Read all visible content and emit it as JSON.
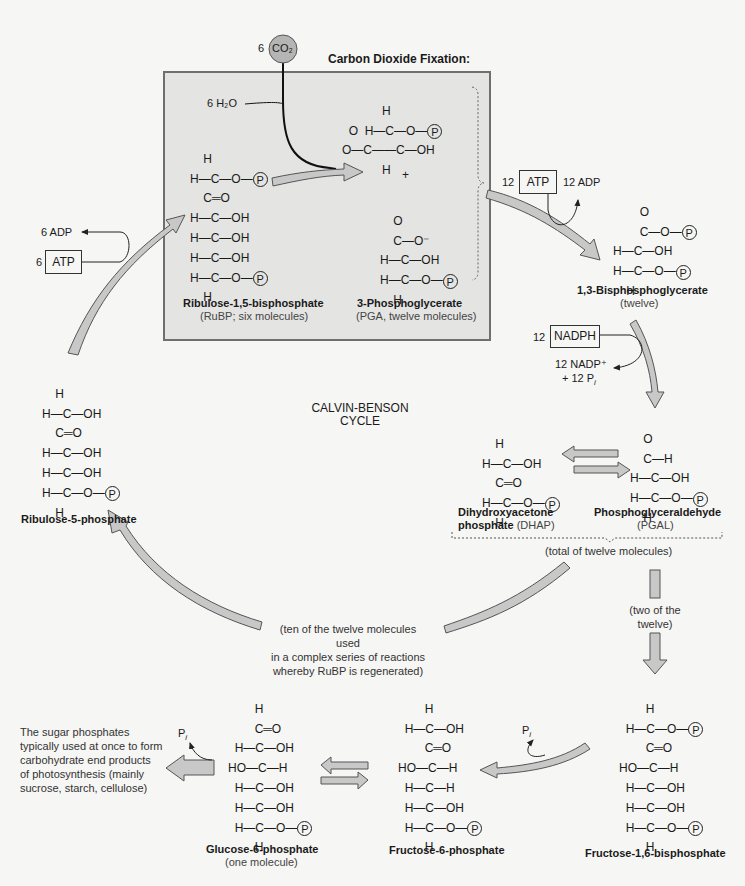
{
  "header": {
    "fixation_title": "Carbon Dioxide Fixation:",
    "co2_count": "6",
    "co2_label": "CO₂",
    "h2o_label": "6 H₂O"
  },
  "cycle_label": [
    "CALVIN-BENSON",
    "CYCLE"
  ],
  "colors": {
    "background": "#f6f6f4",
    "fixation_box": "#e4e4e2",
    "fixation_border": "#6f6f6f",
    "arrow_fill": "#c8c8c8",
    "arrow_stroke": "#555555",
    "co2_circle": "#b5b5b5"
  },
  "molecules": {
    "rubp": {
      "name": "Ribulose-1,5-bisphosphate",
      "sub": "(RuBP; six molecules)",
      "rows": [
        "    H",
        "H—C—O—",
        "    C═O",
        "H—C—OH",
        "H—C—OH",
        "H—C—OH",
        "H—C—O—",
        "    H"
      ]
    },
    "pga": {
      "name": "3-Phosphoglycerate",
      "sub": "(PGA, twelve molecules)",
      "plus": "+"
    },
    "bpg": {
      "name": "1,3-Bisphosphoglycerate",
      "sub": "(twelve)"
    },
    "dhap": {
      "name_line1": "Dihydroxyacetone",
      "name_line2": "phosphate",
      "abbr": "(DHAP)"
    },
    "pgal": {
      "name": "Phosphoglyceraldehyde",
      "sub": "(PGAL)"
    },
    "ru5p": {
      "name": "Ribulose-5-phosphate"
    },
    "g6p": {
      "name": "Glucose-6-phosphate",
      "sub": "(one molecule)"
    },
    "f6p": {
      "name": "Fructose-6-phosphate"
    },
    "f16bp": {
      "name": "Fructose-1,6-bisphosphate"
    }
  },
  "cofactors": {
    "atp_left": {
      "count": "6",
      "label": "ATP",
      "product": "6 ADP"
    },
    "atp_right": {
      "count": "12",
      "label": "ATP",
      "product": "12 ADP"
    },
    "nadph": {
      "count": "12",
      "label": "NADPH",
      "product1": "12 NADP⁺",
      "product2": "+ 12 P",
      "product2_sub": "i"
    },
    "pi_g6p": {
      "label": "P",
      "sub": "i"
    },
    "pi_f16": {
      "label": "P",
      "sub": "i"
    }
  },
  "notes": {
    "total": "(total of twelve molecules)",
    "ten": [
      "(ten of the twelve molecules used",
      "in a complex series of reactions",
      "whereby RuBP is regenerated)"
    ],
    "two": [
      "(two of the",
      "twelve)"
    ],
    "end_products": [
      "The sugar phosphates",
      "typically used at once to form",
      "carbohydrate end products",
      "of photosynthesis (mainly",
      "sucrose, starch, cellulose)"
    ]
  },
  "phosphate_symbol": "P"
}
